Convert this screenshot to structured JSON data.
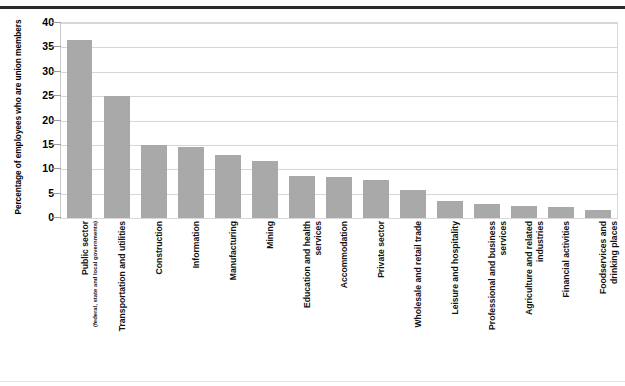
{
  "chart_data": {
    "type": "bar",
    "title": "",
    "subtitle": "",
    "xlabel": "",
    "ylabel": "Percentage of employees who are union members",
    "ylim": [
      0,
      40
    ],
    "yticks": [
      0,
      5,
      10,
      15,
      20,
      25,
      30,
      35,
      40
    ],
    "ytick_labels": [
      "0",
      "5",
      "10",
      "15",
      "20",
      "25",
      "30",
      "35",
      "40"
    ],
    "grid": true,
    "legend": "none",
    "orientation": "vertical",
    "bar_color": "#a9a9a9",
    "categories": [
      "Public sector",
      "Transportation and utilities",
      "Construction",
      "Information",
      "Manufacturing",
      "Mining",
      "Education and health services",
      "Accommodation",
      "Private sector",
      "Wholesale and retail trade",
      "Leisure and hospitality",
      "Professional and business services",
      "Agriculture and related industries",
      "Financial activities",
      "Foodservices and drinking places"
    ],
    "category_lines": [
      [
        "Public sector"
      ],
      [
        "Transportation and utilities"
      ],
      [
        "Construction"
      ],
      [
        "Information"
      ],
      [
        "Manufacturing"
      ],
      [
        "Mining"
      ],
      [
        "Education and health",
        "services"
      ],
      [
        "Accommodation"
      ],
      [
        "Private sector"
      ],
      [
        "Wholesale and retail trade"
      ],
      [
        "Leisure and hospitality"
      ],
      [
        "Professional and business",
        "services"
      ],
      [
        "Agriculture and related",
        "industries"
      ],
      [
        "Financial activities"
      ],
      [
        "Foodservices and",
        "drinking places"
      ]
    ],
    "category_sublabels": [
      "(federal, state and local governments)",
      "",
      "",
      "",
      "",
      "",
      "",
      "",
      "",
      "",
      "",
      "",
      "",
      "",
      ""
    ],
    "values": [
      36.5,
      25.0,
      15.0,
      14.5,
      13.0,
      11.7,
      8.7,
      8.4,
      7.9,
      5.7,
      3.5,
      2.8,
      2.5,
      2.2,
      1.6
    ]
  }
}
